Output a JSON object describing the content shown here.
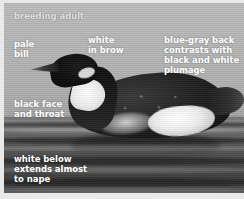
{
  "figure": {
    "kind": "annotated-bird-photograph",
    "caption": "breeding adult",
    "colors": {
      "label_text": "#ffffff",
      "caption_text": "#e2e2e2",
      "sky": "#b6b6b6",
      "water": "#4a4a4a",
      "plumage_dark": "#121212",
      "plumage_white": "#f2f2f2",
      "border": "#e9e9e9"
    }
  },
  "annotations": [
    {
      "id": "pale-bill",
      "text": "pale\nbill"
    },
    {
      "id": "white-brow",
      "text": "white\nin brow"
    },
    {
      "id": "blue-gray",
      "text": "blue-gray back\ncontrasts with\nblack and white\nplumage"
    },
    {
      "id": "black-face",
      "text": "black face\nand throat"
    },
    {
      "id": "white-below",
      "text": "white below\nextends almost\nto nape"
    }
  ]
}
